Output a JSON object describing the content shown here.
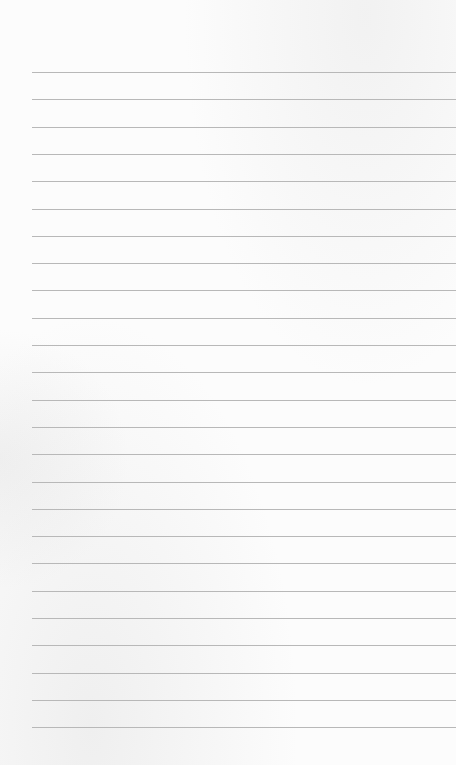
{
  "page": {
    "type": "lined-paper",
    "line_count": 25,
    "first_line_y": 72,
    "line_spacing": 27.3,
    "line_left": 32,
    "line_color": "#b8b8b8",
    "paper_color": "#fbfbfb"
  }
}
